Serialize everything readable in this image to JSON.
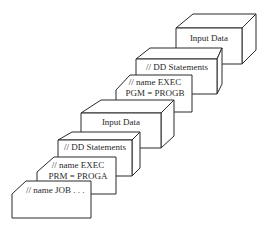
{
  "diagram": {
    "type": "job-control-stack",
    "cards": [
      {
        "id": "input-data-2",
        "shape": "box",
        "lines": [
          "Input Data"
        ]
      },
      {
        "id": "dd-statements-2",
        "shape": "box",
        "lines": [
          "// DD Statements"
        ]
      },
      {
        "id": "exec-progb",
        "shape": "card",
        "lines": [
          "// name EXEC",
          "PGM = PROGB"
        ]
      },
      {
        "id": "input-data-1",
        "shape": "box",
        "lines": [
          "Input Data"
        ]
      },
      {
        "id": "dd-statements-1",
        "shape": "box",
        "lines": [
          "// DD Statements"
        ]
      },
      {
        "id": "exec-proga",
        "shape": "card",
        "lines": [
          "// name EXEC",
          "PRM = PROGA"
        ]
      },
      {
        "id": "job-card",
        "shape": "card",
        "lines": [
          "// name JOB . . ."
        ]
      }
    ]
  },
  "labels": {
    "input_data_2": "Input Data",
    "dd_statements_2": "// DD Statements",
    "exec_progb_line1": "// name EXEC",
    "exec_progb_line2": "PGM = PROGB",
    "input_data_1": "Input Data",
    "dd_statements_1": "// DD Statements",
    "exec_proga_line1": "// name EXEC",
    "exec_proga_line2": "PRM = PROGA",
    "job_line1": "// name JOB . . ."
  },
  "colors": {
    "line": "#2a2a2a",
    "background": "#ffffff"
  }
}
